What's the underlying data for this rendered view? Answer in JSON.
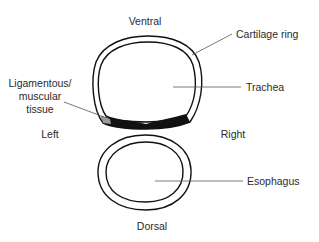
{
  "diagram": {
    "orientation": {
      "top": "Ventral",
      "bottom": "Dorsal",
      "left": "Left",
      "right": "Right"
    },
    "labels": {
      "cartilage_ring": "Cartilage ring",
      "trachea": "Trachea",
      "ligamentous_line1": "Ligamentous/",
      "ligamentous_line2": "muscular",
      "ligamentous_line3": "tissue",
      "esophagus": "Esophagus"
    },
    "colors": {
      "outline": "#111111",
      "muscle_band": "#111111",
      "text": "#2a2a2a",
      "leader": "#555555",
      "background": "#ffffff"
    }
  }
}
